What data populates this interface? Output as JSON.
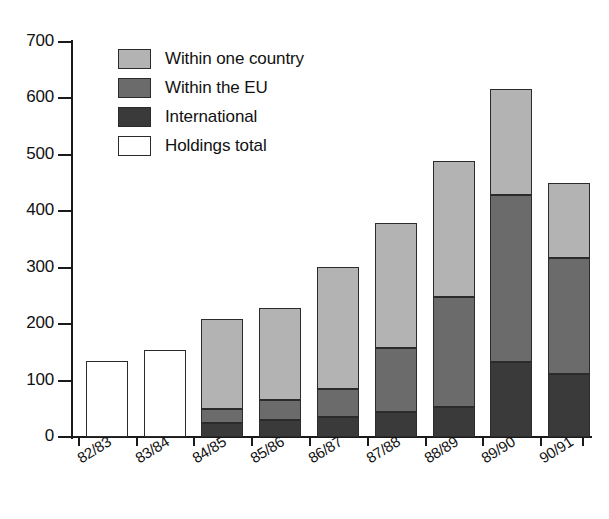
{
  "chart_data": {
    "type": "bar",
    "subtype": "stacked-bar",
    "title": "",
    "xlabel": "",
    "ylabel": "",
    "ylim": [
      0,
      700
    ],
    "ytick_step": 100,
    "yticks": [
      700,
      600,
      500,
      400,
      300,
      200,
      100,
      0
    ],
    "grid": false,
    "legend_position": "top-left-inside",
    "categories": [
      "82/83",
      "83/84",
      "84/85",
      "85/86",
      "86/87",
      "87/88",
      "88/89",
      "89/90",
      "90/91"
    ],
    "series": [
      {
        "name": "Within one country",
        "color": "#b3b3b3",
        "values": [
          null,
          null,
          160,
          163,
          217,
          222,
          242,
          188,
          133
        ]
      },
      {
        "name": "Within the EU",
        "color": "#6b6b6b",
        "values": [
          null,
          null,
          25,
          35,
          50,
          114,
          195,
          296,
          205
        ]
      },
      {
        "name": "International",
        "color": "#3a3a3a",
        "values": [
          null,
          null,
          25,
          30,
          35,
          44,
          53,
          133,
          112
        ]
      },
      {
        "name": "Holdings total",
        "color": "#ffffff",
        "values": [
          135,
          155,
          null,
          null,
          null,
          null,
          null,
          null,
          null
        ]
      }
    ],
    "totals": [
      135,
      155,
      210,
      228,
      302,
      380,
      490,
      618,
      450
    ],
    "bars": [
      {
        "category": "82/83",
        "total": 135,
        "segments": [
          {
            "series": "Holdings total",
            "value": 135
          }
        ]
      },
      {
        "category": "83/84",
        "total": 155,
        "segments": [
          {
            "series": "Holdings total",
            "value": 155
          }
        ]
      },
      {
        "category": "84/85",
        "total": 210,
        "segments": [
          {
            "series": "International",
            "value": 25
          },
          {
            "series": "Within the EU",
            "value": 25
          },
          {
            "series": "Within one country",
            "value": 160
          }
        ]
      },
      {
        "category": "85/86",
        "total": 228,
        "segments": [
          {
            "series": "International",
            "value": 30
          },
          {
            "series": "Within the EU",
            "value": 35
          },
          {
            "series": "Within one country",
            "value": 163
          }
        ]
      },
      {
        "category": "86/87",
        "total": 302,
        "segments": [
          {
            "series": "International",
            "value": 35
          },
          {
            "series": "Within the EU",
            "value": 50
          },
          {
            "series": "Within one country",
            "value": 217
          }
        ]
      },
      {
        "category": "87/88",
        "total": 380,
        "segments": [
          {
            "series": "International",
            "value": 44
          },
          {
            "series": "Within the EU",
            "value": 114
          },
          {
            "series": "Within one country",
            "value": 222
          }
        ]
      },
      {
        "category": "88/89",
        "total": 490,
        "segments": [
          {
            "series": "International",
            "value": 53
          },
          {
            "series": "Within the EU",
            "value": 195
          },
          {
            "series": "Within one country",
            "value": 242
          }
        ]
      },
      {
        "category": "89/90",
        "total": 618,
        "segments": [
          {
            "series": "International",
            "value": 133
          },
          {
            "series": "Within the EU",
            "value": 296
          },
          {
            "series": "Within one country",
            "value": 188
          }
        ]
      },
      {
        "category": "90/91",
        "total": 450,
        "segments": [
          {
            "series": "International",
            "value": 112
          },
          {
            "series": "Within the EU",
            "value": 205
          },
          {
            "series": "Within one country",
            "value": 133
          }
        ]
      }
    ]
  },
  "legend": {
    "items": [
      {
        "label": "Within one country",
        "key": "one-country"
      },
      {
        "label": "Within the EU",
        "key": "within-eu"
      },
      {
        "label": "International",
        "key": "international"
      },
      {
        "label": "Holdings total",
        "key": "holdings"
      }
    ]
  },
  "axes": {
    "y_tick_labels": [
      "700",
      "600",
      "500",
      "400",
      "300",
      "200",
      "100",
      "0"
    ],
    "x_tick_labels": [
      "82/83",
      "83/84",
      "84/85",
      "85/86",
      "86/87",
      "87/88",
      "88/89",
      "89/90",
      "90/91"
    ]
  },
  "colors": {
    "one_country": "#b3b3b3",
    "within_eu": "#6b6b6b",
    "international": "#3a3a3a",
    "holdings": "#ffffff",
    "axis": "#1a1a1a",
    "text": "#111111",
    "background": "#ffffff"
  }
}
